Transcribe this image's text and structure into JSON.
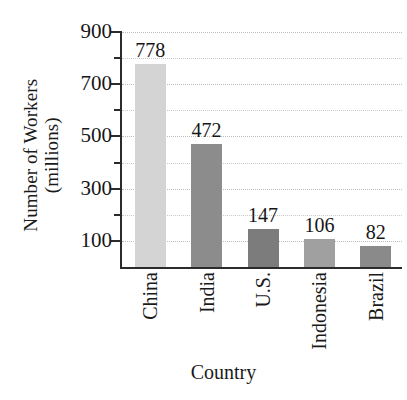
{
  "chart_data": {
    "type": "bar",
    "title": "",
    "subtitle": "",
    "xlabel": "Country",
    "ylabel_line1": "Number of Workers",
    "ylabel_line2": "(millions)",
    "ylabel": "Number of Workers (millions)",
    "categories": [
      "China",
      "India",
      "U.S.",
      "Indonesia",
      "Brazil"
    ],
    "values": [
      778,
      472,
      147,
      106,
      82
    ],
    "value_labels": [
      "778",
      "472",
      "147",
      "106",
      "82"
    ],
    "bar_colors": [
      "#d4d4d4",
      "#8c8c8c",
      "#7c7c7c",
      "#a0a0a0",
      "#8a8a8a"
    ],
    "ylim": [
      0,
      900
    ],
    "ytick_major": [
      900,
      700,
      500,
      300,
      100
    ],
    "ytick_major_labels": [
      "900",
      "700",
      "500",
      "300",
      "100"
    ],
    "ytick_minor": [
      800,
      600,
      400,
      200
    ],
    "grid": true,
    "grid_style": "dotted",
    "grid_color": "#c9c9c9",
    "legend": "none",
    "axis_color": "#2b2b2b",
    "text_color": "#161616",
    "category_label_rotation": -90
  }
}
